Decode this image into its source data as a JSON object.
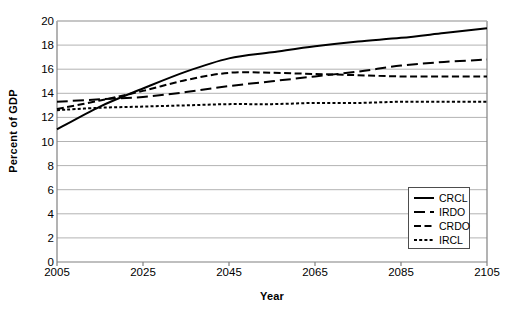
{
  "chart_data": {
    "type": "line",
    "title": "",
    "xlabel": "Year",
    "ylabel": "Percent of GDP",
    "xlim": [
      2005,
      2105
    ],
    "ylim": [
      0,
      20
    ],
    "xticks": [
      2005,
      2025,
      2045,
      2065,
      2085,
      2105
    ],
    "yticks": [
      0,
      2,
      4,
      6,
      8,
      10,
      12,
      14,
      16,
      18,
      20
    ],
    "grid": "horizontal",
    "legend_position": "bottom-right",
    "x": [
      2005,
      2015,
      2025,
      2035,
      2045,
      2055,
      2065,
      2075,
      2085,
      2095,
      2105
    ],
    "series": [
      {
        "name": "CRCL",
        "style": "solid",
        "color": "#000000",
        "values": [
          11.0,
          12.9,
          14.4,
          15.8,
          16.9,
          17.4,
          17.9,
          18.3,
          18.6,
          19.0,
          19.4
        ]
      },
      {
        "name": "IRDO",
        "style": "long-dash",
        "color": "#000000",
        "values": [
          13.3,
          13.5,
          13.7,
          14.1,
          14.6,
          15.0,
          15.4,
          15.8,
          16.3,
          16.6,
          16.8
        ]
      },
      {
        "name": "CRDO",
        "style": "medium-dash",
        "color": "#000000",
        "values": [
          12.7,
          13.4,
          14.2,
          15.1,
          15.7,
          15.7,
          15.6,
          15.5,
          15.4,
          15.4,
          15.4
        ]
      },
      {
        "name": "IRCL",
        "style": "dotted",
        "color": "#000000",
        "values": [
          12.6,
          12.8,
          12.9,
          13.0,
          13.1,
          13.1,
          13.2,
          13.2,
          13.3,
          13.3,
          13.3
        ]
      }
    ]
  },
  "legend": {
    "items": [
      {
        "label": "CRCL",
        "style": "solid"
      },
      {
        "label": "IRDO",
        "style": "long-dash"
      },
      {
        "label": "CRDO",
        "style": "medium-dash"
      },
      {
        "label": "IRCL",
        "style": "dotted"
      }
    ]
  },
  "colors": {
    "line": "#000000",
    "grid": "#b3b3b3",
    "axis": "#808080",
    "legend_border": "#4d4d4d",
    "background": "#ffffff"
  }
}
